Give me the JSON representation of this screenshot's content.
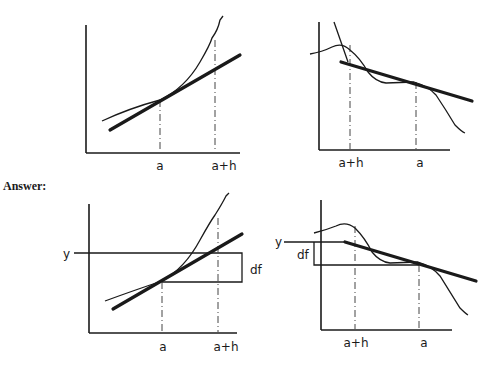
{
  "answer_label": "Answer:",
  "panels": {
    "top_left": {
      "x_labels": [
        "a",
        "a+h"
      ]
    },
    "top_right": {
      "x_labels": [
        "a+h",
        "a"
      ]
    },
    "bottom_left": {
      "x_labels": [
        "a",
        "a+h"
      ],
      "y_label": "y",
      "delta_label": "df"
    },
    "bottom_right": {
      "x_labels": [
        "a+h",
        "a"
      ],
      "y_label": "y",
      "delta_label": "df"
    }
  },
  "colors": {
    "ink": "#1a1a1a",
    "background": "#ffffff"
  }
}
